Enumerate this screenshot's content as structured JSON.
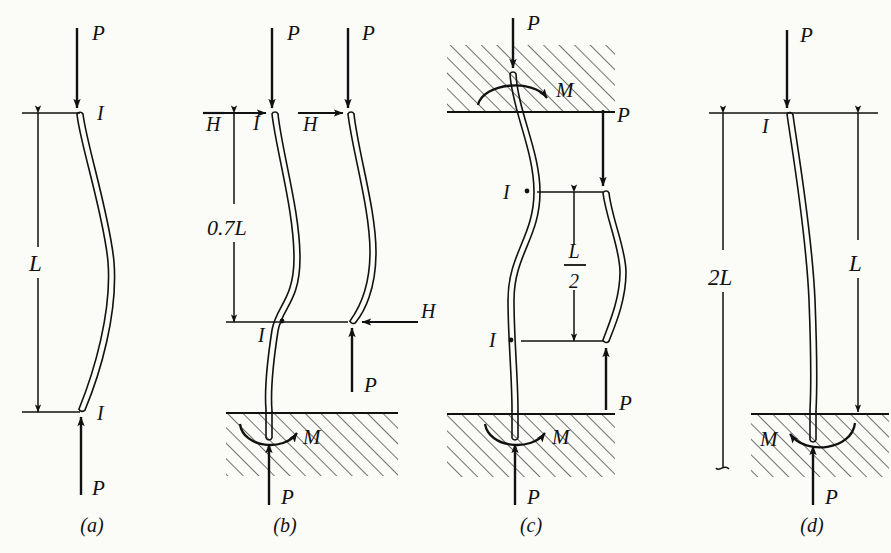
{
  "figure": {
    "type": "engineering-diagram",
    "ink_color": "#111111",
    "paper_color": "#fbfbf8"
  },
  "panels": [
    {
      "key": "a",
      "caption": "(a)",
      "end_conditions": "pinned-pinned",
      "shape": "single curvature bow",
      "dimension": {
        "label": "L",
        "side": "left"
      },
      "loads": [
        {
          "name": "P",
          "label": "P",
          "position": "top",
          "direction": "down"
        },
        {
          "name": "P",
          "label": "P",
          "position": "bottom",
          "direction": "up"
        }
      ],
      "inflection_labels": [
        {
          "label": "I",
          "position": "top-end"
        },
        {
          "label": "I",
          "position": "bottom-end"
        }
      ],
      "supports": []
    },
    {
      "key": "b",
      "caption": "(b)",
      "end_conditions": "fixed-pinned",
      "shape": "bow above inflection, reverse curve into base",
      "dimension": {
        "label": "0.7L",
        "side": "left"
      },
      "loads": [
        {
          "name": "P",
          "label": "P",
          "position": "top",
          "direction": "down"
        },
        {
          "name": "H",
          "label": "H",
          "position": "top",
          "direction": "right"
        },
        {
          "name": "P",
          "label": "P",
          "position": "base",
          "direction": "up"
        },
        {
          "name": "M",
          "label": "M",
          "position": "base",
          "direction": "moment"
        }
      ],
      "inflection_labels": [
        {
          "label": "I",
          "position": "top-end"
        },
        {
          "label": "I",
          "position": "mid-inflection"
        }
      ],
      "free_body": {
        "loads": [
          {
            "name": "P",
            "label": "P",
            "position": "top",
            "direction": "down"
          },
          {
            "name": "H",
            "label": "H",
            "position": "top",
            "direction": "right"
          },
          {
            "name": "P",
            "label": "P",
            "position": "bottom",
            "direction": "up"
          },
          {
            "name": "H",
            "label": "H",
            "position": "bottom",
            "direction": "left"
          }
        ]
      },
      "supports": [
        "hatched-ground-base"
      ]
    },
    {
      "key": "c",
      "caption": "(c)",
      "end_conditions": "fixed-fixed",
      "shape": "S curve with two inflection points",
      "dimension": {
        "label_numerator": "L",
        "label_denominator": "2",
        "side": "right-of-column"
      },
      "loads": [
        {
          "name": "P",
          "label": "P",
          "position": "top",
          "direction": "down"
        },
        {
          "name": "M",
          "label": "M",
          "position": "top-support",
          "direction": "moment"
        },
        {
          "name": "P",
          "label": "P",
          "position": "base",
          "direction": "up"
        },
        {
          "name": "M",
          "label": "M",
          "position": "base-support",
          "direction": "moment"
        }
      ],
      "inflection_labels": [
        {
          "label": "I",
          "position": "upper-inflection"
        },
        {
          "label": "I",
          "position": "lower-inflection"
        }
      ],
      "free_body": {
        "loads": [
          {
            "name": "P",
            "label": "P",
            "position": "top",
            "direction": "down"
          },
          {
            "name": "P",
            "label": "P",
            "position": "bottom",
            "direction": "up"
          }
        ]
      },
      "supports": [
        "hatched-ground-top",
        "hatched-ground-base"
      ]
    },
    {
      "key": "d",
      "caption": "(d)",
      "end_conditions": "fixed-free (cantilever)",
      "shape": "quarter-sine cantilever sway",
      "dimensions": [
        {
          "label": "2L",
          "side": "left"
        },
        {
          "label": "L",
          "side": "right"
        }
      ],
      "loads": [
        {
          "name": "P",
          "label": "P",
          "position": "top",
          "direction": "down"
        },
        {
          "name": "P",
          "label": "P",
          "position": "base",
          "direction": "up"
        },
        {
          "name": "M",
          "label": "M",
          "position": "base-support",
          "direction": "moment"
        }
      ],
      "inflection_labels": [
        {
          "label": "I",
          "position": "top-end"
        }
      ],
      "supports": [
        "hatched-ground-base"
      ]
    }
  ],
  "labels": {
    "P": "P",
    "H": "H",
    "M": "M",
    "I": "I",
    "L": "L",
    "two": "2",
    "zero_seven_L": "0.7L",
    "two_L": "2L",
    "caption_a": "(a)",
    "caption_b": "(b)",
    "caption_c": "(c)",
    "caption_d": "(d)"
  }
}
